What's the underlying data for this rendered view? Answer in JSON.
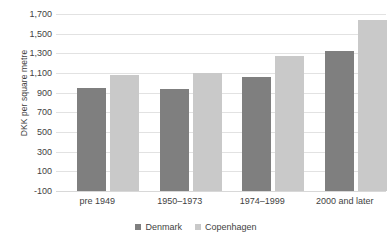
{
  "chart_data": {
    "type": "bar",
    "title": "",
    "xlabel": "",
    "ylabel": "DKK per square metre",
    "categories": [
      "pre 1949",
      "1950–1973",
      "1974–1999",
      "2000 and later"
    ],
    "series": [
      {
        "name": "Denmark",
        "color": "#7f7f7f",
        "values": [
          950,
          940,
          1060,
          1320
        ]
      },
      {
        "name": "Copenhagen",
        "color": "#c9c9c9",
        "values": [
          1080,
          1100,
          1270,
          1640
        ]
      }
    ],
    "ylim": [
      -100,
      1700
    ],
    "ytick_step": 200,
    "yticks": [
      "1,700",
      "1,500",
      "1,300",
      "1,100",
      "900",
      "700",
      "500",
      "300",
      "100",
      "-100"
    ],
    "ytick_values": [
      1700,
      1500,
      1300,
      1100,
      900,
      700,
      500,
      300,
      100,
      -100
    ],
    "grid": true,
    "legend_position": "bottom"
  },
  "legend": {
    "items": [
      {
        "label": "Denmark"
      },
      {
        "label": "Copenhagen"
      }
    ]
  }
}
